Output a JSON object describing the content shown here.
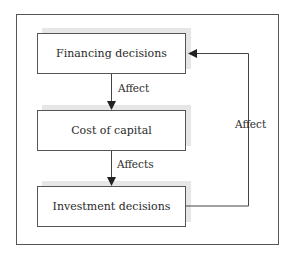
{
  "diagram": {
    "nodes": [
      {
        "id": "financing",
        "label": "Financing decisions"
      },
      {
        "id": "cost",
        "label": "Cost of capital"
      },
      {
        "id": "investment",
        "label": "Investment decisions"
      }
    ],
    "edges": [
      {
        "from": "financing",
        "to": "cost",
        "label": "Affect"
      },
      {
        "from": "cost",
        "to": "investment",
        "label": "Affects"
      },
      {
        "from": "investment",
        "to": "financing",
        "label": "Affect"
      }
    ],
    "colors": {
      "line": "#555555",
      "shadow": "#e6e6e6",
      "text": "#2a2a2a"
    }
  }
}
